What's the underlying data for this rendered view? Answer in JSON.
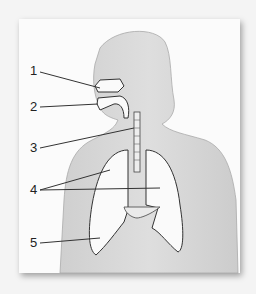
{
  "diagram": {
    "labels": [
      {
        "number": "1",
        "x": 30,
        "y": 64
      },
      {
        "number": "2",
        "x": 30,
        "y": 98
      },
      {
        "number": "3",
        "x": 30,
        "y": 139
      },
      {
        "number": "4",
        "x": 30,
        "y": 183
      },
      {
        "number": "5",
        "x": 30,
        "y": 236
      }
    ],
    "colors": {
      "background": "#f4f4f4",
      "frame": "#fbfbfb",
      "body": "#d6d6d6",
      "lungs": "#fafafa",
      "outline": "#333333"
    }
  }
}
